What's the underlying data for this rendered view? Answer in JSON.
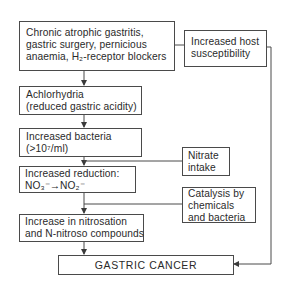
{
  "diagram": {
    "type": "flowchart",
    "nodes": {
      "causes": {
        "lines": [
          "Chronic atrophic gastritis,",
          "gastric surgery, pernicious",
          "anaemia, H₂-receptor blockers"
        ]
      },
      "host": {
        "lines": [
          "Increased host",
          "susceptibility"
        ]
      },
      "achlorhydria": {
        "lines": [
          "Achlorhydria",
          "(reduced gastric acidity)"
        ]
      },
      "bacteria": {
        "lines": [
          "Increased bacteria",
          "(>10⁷/ml)"
        ]
      },
      "nitrate": {
        "lines": [
          "Nitrate",
          "intake"
        ]
      },
      "reduction": {
        "lines": [
          "Increased reduction:",
          "NO₃⁻→NO₂⁻"
        ]
      },
      "catalysis": {
        "lines": [
          "Catalysis by",
          "chemicals",
          "and bacteria"
        ]
      },
      "nitrosation": {
        "lines": [
          "Increase in nitrosation",
          "and N-nitroso compounds"
        ]
      },
      "cancer": {
        "label": "GASTRIC CANCER"
      }
    },
    "edges": [
      {
        "from": "causes",
        "to": "achlorhydria"
      },
      {
        "from": "causes",
        "to": "host"
      },
      {
        "from": "achlorhydria",
        "to": "bacteria"
      },
      {
        "from": "bacteria",
        "to": "reduction"
      },
      {
        "from": "nitrate",
        "to": "reduction"
      },
      {
        "from": "reduction",
        "to": "nitrosation"
      },
      {
        "from": "catalysis",
        "to": "nitrosation"
      },
      {
        "from": "nitrosation",
        "to": "cancer"
      },
      {
        "from": "host",
        "to": "cancer"
      }
    ],
    "colors": {
      "line": "#4a4a4a",
      "text": "#2a2a2a",
      "background": "#ffffff"
    }
  }
}
